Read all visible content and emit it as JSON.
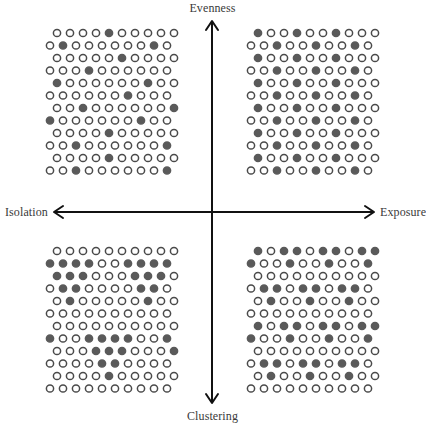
{
  "axes": {
    "top_label": "Evenness",
    "bottom_label": "Clustering",
    "left_label": "Isolation",
    "right_label": "Exposure"
  },
  "style": {
    "hollow_stroke": "#4a4a4a",
    "filled_color": "#5a5a5a",
    "axis_color": "#111111",
    "label_color": "#3a3a3a"
  },
  "grid_legend": {
    "empty_symbol": "o",
    "filled_symbol": "x",
    "rows_per_quadrant": 12,
    "circles_per_row": 10,
    "odd_rows_indented": true
  },
  "quadrants": {
    "top_left": {
      "name": "low exposure, high evenness",
      "rows": [
        "ooooxooooo",
        "oxooooooxo",
        "oooooxoooo",
        "oooxoooooo",
        "xooooooxoo",
        "ooooooxooo",
        "ooxoooooox",
        "xooooooxoo",
        "ooooxooooo",
        "ooxoooooox",
        "ooooxooooo",
        "ooxoooooox"
      ]
    },
    "top_right": {
      "name": "high exposure, high evenness",
      "rows": [
        "xooxooxooo",
        "ooxooxooxo",
        "xooxooxooo",
        "ooxooxooxo",
        "xooxooxooo",
        "ooxooxooxo",
        "xooxooxooo",
        "ooxooxooxo",
        "xooxooxooo",
        "ooxooxooxo",
        "xooxooxooo",
        "ooxooxooxo"
      ]
    },
    "bottom_left": {
      "name": "low exposure, high clustering",
      "rows": [
        "oooooooooo",
        "xxxxooxxxx",
        "xxxoooxxxo",
        "oxxooooxxo",
        "oxoooooxoo",
        "oooooooooo",
        "oooooooooo",
        "xooxxxxoox",
        "oooxxxooox",
        "ooooxxoooo",
        "ooooxooooo",
        "oooooooooo"
      ]
    },
    "bottom_right": {
      "name": "high exposure, high clustering",
      "rows": [
        "xoxxoxxoxx",
        "xooxooxoox",
        "oooooooooo",
        "oxxoxxoxxo",
        "oxooxooxoo",
        "oooooooooo",
        "xoxxoxxoxx",
        "xooxooxoox",
        "oooooooooo",
        "oxxoxxoxxo",
        "oxooxooxoo",
        "oooooooooo"
      ]
    }
  }
}
